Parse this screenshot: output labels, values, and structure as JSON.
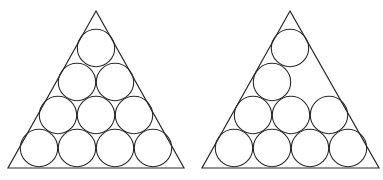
{
  "figure": {
    "stroke_color": "#2a2a2a",
    "background": "#ffffff",
    "circle_radius": 18.7,
    "panels": [
      {
        "name": "left-triangle-10-circles",
        "triangle": [
          [
            96,
            11
          ],
          [
            8,
            168
          ],
          [
            184,
            168
          ]
        ],
        "circles": [
          [
            96,
            48
          ],
          [
            77,
            82
          ],
          [
            115,
            82
          ],
          [
            58,
            115
          ],
          [
            96,
            115
          ],
          [
            134,
            115
          ],
          [
            39,
            148
          ],
          [
            77,
            148
          ],
          [
            115,
            148
          ],
          [
            153,
            148
          ]
        ]
      },
      {
        "name": "right-triangle-9-circles",
        "triangle": [
          [
            290,
            11
          ],
          [
            202,
            168
          ],
          [
            379,
            168
          ]
        ],
        "circles": [
          [
            290,
            48
          ],
          [
            272,
            82
          ],
          [
            253,
            115
          ],
          [
            291,
            115
          ],
          [
            329,
            115
          ],
          [
            234,
            148
          ],
          [
            272,
            148
          ],
          [
            310,
            148
          ],
          [
            348,
            148
          ]
        ]
      }
    ]
  }
}
